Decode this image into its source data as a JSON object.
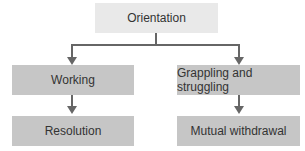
{
  "diagram": {
    "nodes": {
      "orientation": "Orientation",
      "working": "Working",
      "grappling": "Grappling and struggling",
      "resolution": "Resolution",
      "withdrawal": "Mutual withdrawal"
    },
    "edges": [
      {
        "from": "Orientation",
        "to": "Working"
      },
      {
        "from": "Orientation",
        "to": "Grappling and struggling"
      },
      {
        "from": "Working",
        "to": "Resolution"
      },
      {
        "from": "Grappling and struggling",
        "to": "Mutual withdrawal"
      }
    ],
    "colors": {
      "top_box": "#e9e9e9",
      "lower_boxes": "#c6c6c6",
      "connectors": "#666666"
    }
  }
}
